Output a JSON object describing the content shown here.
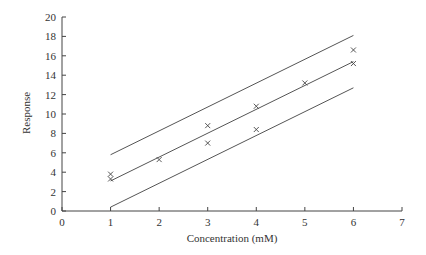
{
  "chart_data": {
    "type": "scatter",
    "title": "",
    "xlabel": "Concentration (mM)",
    "ylabel": "Response",
    "xlim": [
      0,
      7
    ],
    "ylim": [
      0,
      20
    ],
    "xticks": [
      0,
      1,
      2,
      3,
      4,
      5,
      6,
      7
    ],
    "yticks": [
      0,
      2,
      4,
      6,
      8,
      10,
      12,
      14,
      16,
      18,
      20
    ],
    "grid": false,
    "legend": null,
    "points": {
      "name": "Observations",
      "marker": "x",
      "x": [
        1,
        1,
        2,
        3,
        3,
        4,
        4,
        5,
        6,
        6
      ],
      "y": [
        3.8,
        3.3,
        5.3,
        8.8,
        7.0,
        10.8,
        8.4,
        13.2,
        16.6,
        15.2
      ]
    },
    "lines": [
      {
        "name": "Upper prediction band",
        "x": [
          1,
          6
        ],
        "y": [
          5.8,
          18.1
        ]
      },
      {
        "name": "Regression line",
        "x": [
          1,
          6
        ],
        "y": [
          3.1,
          15.4
        ]
      },
      {
        "name": "Lower prediction band",
        "x": [
          1,
          6
        ],
        "y": [
          0.4,
          12.7
        ]
      }
    ]
  }
}
